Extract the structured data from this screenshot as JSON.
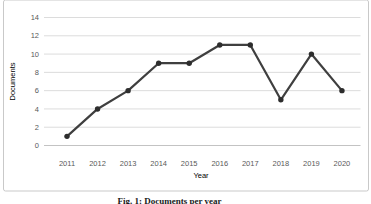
{
  "figure": {
    "caption": "Fig. 1: Documents per year"
  },
  "chart_data": {
    "type": "line",
    "title": "",
    "xlabel": "Year",
    "ylabel": "Documents",
    "categories": [
      "2011",
      "2012",
      "2013",
      "2014",
      "2015",
      "2016",
      "2017",
      "2018",
      "2019",
      "2020"
    ],
    "series": [
      {
        "name": "Documents",
        "values": [
          1,
          4,
          6,
          9,
          9,
          11,
          11,
          5,
          10,
          6
        ]
      }
    ],
    "yticks": [
      0,
      2,
      4,
      6,
      8,
      10,
      12,
      14
    ],
    "ylim": [
      0,
      14
    ],
    "grid": true,
    "legend": false,
    "marker": "circle",
    "colors": {
      "line": "#3f3f3f",
      "marker": "#2d2d2d",
      "gridline": "#dcdcdc",
      "axis_line": "#c3c3c3",
      "tick_text": "#595959",
      "frame_border": "#c9c9c9"
    }
  }
}
